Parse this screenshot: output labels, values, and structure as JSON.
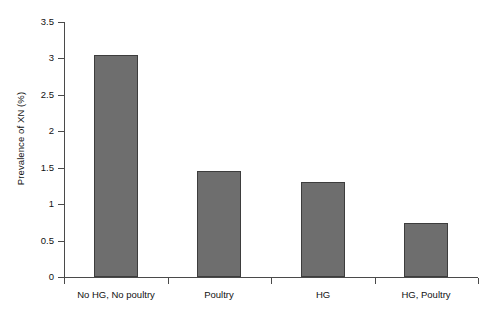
{
  "chart_data": {
    "type": "bar",
    "title": "",
    "subtitle": "",
    "xlabel": "",
    "ylabel": "Prevalence of XN (%)",
    "categories": [
      "No HG, No poultry",
      "Poultry",
      "HG",
      "HG, Poultry"
    ],
    "values": [
      3.05,
      1.46,
      1.3,
      0.74
    ],
    "series": [
      {
        "name": "Prevalence of XN (%)",
        "values": [
          3.05,
          1.46,
          1.3,
          0.74
        ]
      }
    ],
    "ylim": [
      0,
      3.5
    ],
    "y_ticks": [
      "0",
      "0.5",
      "1",
      "1.5",
      "2",
      "2.5",
      "3",
      "3.5"
    ],
    "y_tick_values": [
      0,
      0.5,
      1,
      1.5,
      2,
      2.5,
      3,
      3.5
    ],
    "grid": false,
    "legend": "none",
    "bar_color": "#6e6e6e",
    "bar_edge_color": "#3d3d3d",
    "axis_color": "#4a4a4a",
    "background_color": "#ffffff"
  }
}
